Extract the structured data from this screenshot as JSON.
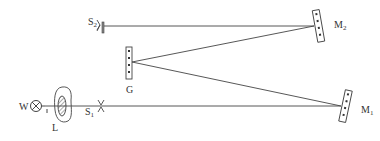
{
  "diagram": {
    "type": "optical spectrometer setup (grating, mirrors, slits)",
    "colors": {
      "line": "#444444",
      "text": "#333333",
      "background": "#ffffff"
    },
    "labels": {
      "lamp": {
        "main": "W",
        "sub": ""
      },
      "lens": {
        "main": "L",
        "sub": ""
      },
      "slit1": {
        "main": "S",
        "sub": "1"
      },
      "slit2": {
        "main": "S",
        "sub": "2"
      },
      "grating": {
        "main": "G",
        "sub": ""
      },
      "mirror1": {
        "main": "M",
        "sub": "1"
      },
      "mirror2": {
        "main": "M",
        "sub": "2"
      }
    },
    "components": [
      {
        "id": "W",
        "kind": "lamp",
        "icon": "lamp-cross-circle"
      },
      {
        "id": "L",
        "kind": "lens",
        "icon": "hatched-lens"
      },
      {
        "id": "S1",
        "kind": "entrance slit",
        "icon": "slit"
      },
      {
        "id": "M1",
        "kind": "mirror",
        "icon": "mirror"
      },
      {
        "id": "G",
        "kind": "diffraction grating",
        "icon": "grating"
      },
      {
        "id": "M2",
        "kind": "mirror",
        "icon": "mirror"
      },
      {
        "id": "S2",
        "kind": "exit slit",
        "icon": "slit"
      }
    ],
    "beam_path": [
      "W",
      "L",
      "S1",
      "M1",
      "G",
      "M2",
      "S2"
    ]
  }
}
